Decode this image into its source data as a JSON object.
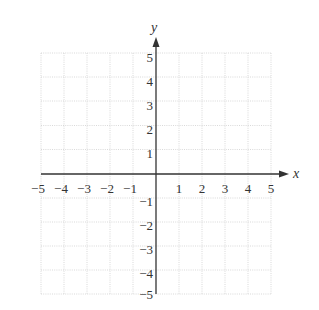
{
  "diagram": {
    "type": "coordinate-grid",
    "x_axis": {
      "label": "x",
      "min": -5,
      "max": 5,
      "ticks": [
        "-5",
        "-4",
        "-3",
        "-2",
        "-1",
        "1",
        "2",
        "3",
        "4",
        "5"
      ]
    },
    "y_axis": {
      "label": "y",
      "min": -5,
      "max": 5,
      "ticks": [
        "5",
        "4",
        "3",
        "2",
        "1",
        "-1",
        "-2",
        "-3",
        "-4",
        "-5"
      ]
    },
    "grid": {
      "style": "dotted",
      "color": "#c8c8c8",
      "step": 1
    },
    "axis_color": "#333333"
  },
  "labels": {
    "x_ticks": {
      "n5": "−5",
      "n4": "−4",
      "n3": "−3",
      "n2": "−2",
      "n1": "−1",
      "p1": "1",
      "p2": "2",
      "p3": "3",
      "p4": "4",
      "p5": "5"
    },
    "y_ticks": {
      "p5": "5",
      "p4": "4",
      "p3": "3",
      "p2": "2",
      "p1": "1",
      "n1": "−1",
      "n2": "−2",
      "n3": "−3",
      "n4": "−4",
      "n5": "−5"
    },
    "x_axis": "x",
    "y_axis": "y"
  }
}
